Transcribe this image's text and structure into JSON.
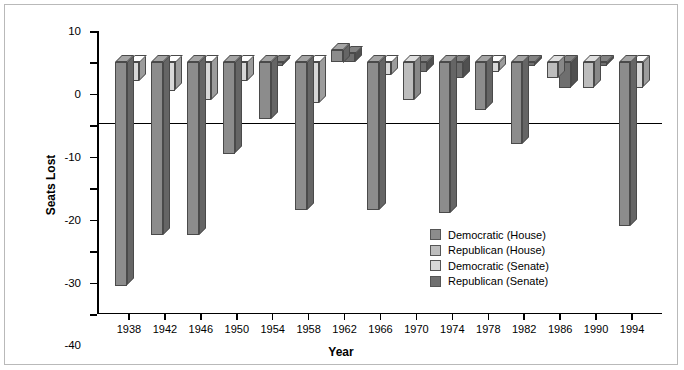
{
  "chart_data": {
    "type": "bar",
    "title": "",
    "xlabel": "Year",
    "ylabel": "Seats Lost",
    "ylim": [
      -80,
      10
    ],
    "ytick_values": [
      10,
      0,
      -10,
      -20,
      -30,
      -40,
      -50,
      -60,
      -70,
      -80
    ],
    "ytick_labels": [
      "10",
      "0",
      "-10",
      "-20",
      "-30",
      "-40",
      "-50",
      "-60",
      "-70",
      "-80"
    ],
    "grid": false,
    "legend_position": "inside-lower-right",
    "categories": [
      "1938",
      "1942",
      "1946",
      "1950",
      "1954",
      "1958",
      "1962",
      "1966",
      "1970",
      "1974",
      "1978",
      "1982",
      "1986",
      "1990",
      "1994"
    ],
    "series": [
      {
        "name": "Democratic (House)",
        "color": "#8c8c8c",
        "values": [
          -71,
          -55,
          -55,
          -29,
          -18,
          -47,
          4,
          -47,
          null,
          -48,
          -15,
          -26,
          null,
          null,
          -52
        ]
      },
      {
        "name": "Republican (House)",
        "color": "#bdbdbd",
        "values": [
          null,
          null,
          null,
          null,
          null,
          null,
          null,
          null,
          -12,
          null,
          null,
          null,
          -5,
          -8,
          null
        ]
      },
      {
        "name": "Democratic (Senate)",
        "color": "#d8d8d8",
        "values": [
          -6,
          -9,
          -12,
          -6,
          null,
          -13,
          null,
          -4,
          null,
          null,
          -3,
          null,
          null,
          null,
          -8
        ]
      },
      {
        "name": "Republican (Senate)",
        "color": "#6f6f6f",
        "values": [
          null,
          null,
          null,
          null,
          -1,
          null,
          3,
          null,
          -3,
          -5,
          null,
          -1,
          -8,
          -1,
          null
        ]
      }
    ]
  },
  "legend": {
    "items": [
      {
        "label": "Democratic (House)",
        "color": "#8c8c8c"
      },
      {
        "label": "Republican (House)",
        "color": "#bdbdbd"
      },
      {
        "label": "Democratic (Senate)",
        "color": "#d8d8d8"
      },
      {
        "label": "Republican (Senate)",
        "color": "#6f6f6f"
      }
    ]
  },
  "axes": {
    "y_title": "Seats Lost",
    "x_title": "Year"
  }
}
